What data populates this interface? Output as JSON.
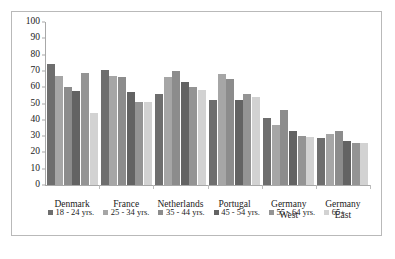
{
  "chart_data": {
    "type": "bar",
    "title": "",
    "subtitle": "",
    "xlabel": "",
    "ylabel": "",
    "ylim": [
      0,
      100
    ],
    "ytick_step": 10,
    "yticks": [
      0,
      10,
      20,
      30,
      40,
      50,
      60,
      70,
      80,
      90,
      100
    ],
    "grid": false,
    "legend_position": "bottom",
    "categories": [
      "Denmark",
      "France",
      "Netherlands",
      "Portugal",
      "Germany\nWest",
      "Germany\nEast"
    ],
    "series": [
      {
        "name": "18 - 24 yrs.",
        "color": "#6e6e6e",
        "values": [
          74,
          70.5,
          56,
          52,
          41,
          29
        ]
      },
      {
        "name": "25 - 34 yrs.",
        "color": "#a6a6a6",
        "values": [
          67,
          67,
          66,
          68,
          37,
          31
        ]
      },
      {
        "name": "35 - 44 yrs.",
        "color": "#8c8c8c",
        "values": [
          60,
          66.5,
          70,
          65,
          46,
          33
        ]
      },
      {
        "name": "45 - 54 yrs.",
        "color": "#636363",
        "values": [
          57.5,
          57,
          63,
          52,
          33,
          27
        ]
      },
      {
        "name": "55 - 64 yrs.",
        "color": "#949494",
        "values": [
          68.5,
          51,
          60,
          56,
          30,
          25.5
        ]
      },
      {
        "name": "65+",
        "color": "#d2d2d2",
        "values": [
          44,
          51,
          58,
          54,
          29.5,
          25.5
        ]
      }
    ]
  },
  "axis": {
    "y_max_label": "100",
    "y_min_label": "0"
  }
}
